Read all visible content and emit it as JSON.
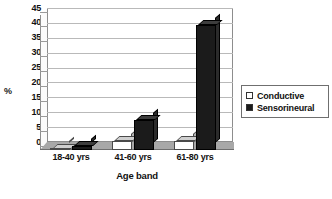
{
  "chart_data": {
    "type": "bar",
    "title": "",
    "subtitle": "",
    "xlabel": "Age band",
    "ylabel": "%",
    "categories": [
      "18-40 yrs",
      "41-60 yrs",
      "61-80 yrs"
    ],
    "series": [
      {
        "name": "Conductive",
        "values": [
          0.3,
          3,
          3
        ],
        "color": "#ffffff"
      },
      {
        "name": "Sensorineural",
        "values": [
          1.5,
          10,
          42
        ],
        "color": "#1b1b1b"
      }
    ],
    "ylim": [
      0,
      45
    ],
    "yticks": [
      0,
      5,
      10,
      15,
      20,
      25,
      30,
      35,
      40,
      45
    ],
    "ytick_labels": [
      "0",
      "5",
      "10",
      "15",
      "20",
      "25",
      "30",
      "35",
      "40",
      "45"
    ],
    "grid": true,
    "grid_axis": "y",
    "legend_position": "right",
    "style": "3d-column",
    "background": "#ffffff",
    "plot_border_color": "#8d8d8d",
    "gridline_color": "#b9b9b9",
    "floor_color": "#a8a8a8"
  },
  "legend": {
    "items": [
      {
        "label": "Conductive",
        "swatch": "white-square"
      },
      {
        "label": "Sensorineural",
        "swatch": "black-square"
      }
    ]
  }
}
